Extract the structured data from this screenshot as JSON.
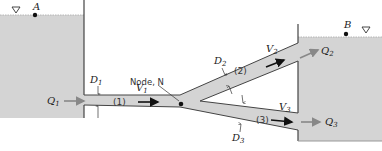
{
  "diagram": {
    "type": "pipe-network",
    "colors": {
      "fluid": "#d4d4d4",
      "wall": "#444444",
      "arrow": "#111111",
      "flow_arrow": "#888888"
    },
    "reservoirs": [
      {
        "id": "A",
        "label": "A",
        "surface_marker": "free-surface-triangle"
      },
      {
        "id": "B",
        "label": "B",
        "surface_marker": "free-surface-triangle"
      }
    ],
    "node": {
      "label": "Node, N"
    },
    "pipes": [
      {
        "id": "1",
        "label": "(1)",
        "diameter": "D",
        "diameter_sub": "1",
        "velocity": "V",
        "velocity_sub": "1"
      },
      {
        "id": "2",
        "label": "(2)",
        "diameter": "D",
        "diameter_sub": "2",
        "velocity": "V",
        "velocity_sub": "2"
      },
      {
        "id": "3",
        "label": "(3)",
        "diameter": "D",
        "diameter_sub": "3",
        "velocity": "V",
        "velocity_sub": "3"
      }
    ],
    "flows": [
      {
        "label": "Q",
        "sub": "1"
      },
      {
        "label": "Q",
        "sub": "2"
      },
      {
        "label": "Q",
        "sub": "3"
      }
    ]
  }
}
